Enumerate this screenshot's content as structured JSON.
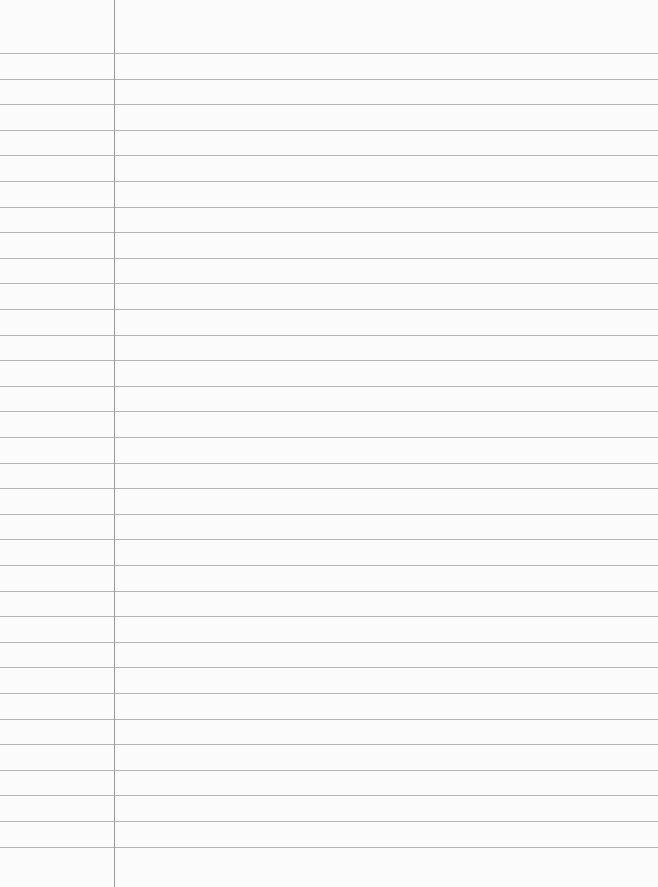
{
  "paper": {
    "background": "#fbfbfb",
    "rule_color": "#b4b4b4",
    "margin_color": "#9a9a9a",
    "margin_x": 114,
    "first_rule_y": 53,
    "rule_spacing": 25.6,
    "rule_count": 32
  }
}
